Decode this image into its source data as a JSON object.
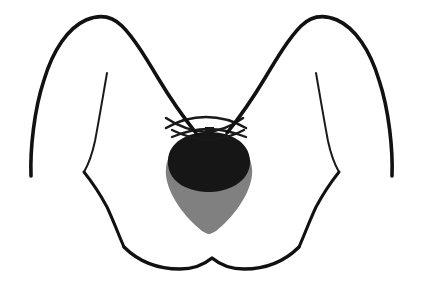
{
  "figure": {
    "caption": "",
    "background_color": "#ffffff",
    "width": 423,
    "height": 293
  },
  "palette": {
    "outline_black": "#111111",
    "mass_black": "#161616",
    "gland_gray": "#808080",
    "paper_white": "#ffffff"
  },
  "strokes": {
    "body_outline_width": 3.6,
    "inner_contour_width": 2.0,
    "clavicle_width": 2.6
  },
  "parts": [
    {
      "id": "left-shoulder-arm",
      "label": "Left shoulder and upper arm contour",
      "stroke_width": 3.6
    },
    {
      "id": "right-shoulder-arm",
      "label": "Right shoulder and upper arm contour",
      "stroke_width": 3.6
    },
    {
      "id": "left-axilla-fold",
      "label": "Left axillary fold line",
      "stroke_width": 2.0
    },
    {
      "id": "right-axilla-fold",
      "label": "Right axillary fold line",
      "stroke_width": 2.0
    },
    {
      "id": "left-pectoral-edge",
      "label": "Left pectoral border descending to costal margin",
      "stroke_width": 3.0
    },
    {
      "id": "right-pectoral-edge",
      "label": "Right pectoral border descending to costal margin",
      "stroke_width": 3.0
    },
    {
      "id": "costal-margin",
      "label": "Lower costal margin wavy contour",
      "stroke_width": 3.4
    },
    {
      "id": "left-clavicle-upper",
      "label": "Left clavicle upper arc",
      "stroke_width": 2.6
    },
    {
      "id": "right-clavicle-upper",
      "label": "Right clavicle upper arc",
      "stroke_width": 2.6
    },
    {
      "id": "left-clavicle-lower",
      "label": "Left clavicle lower arc",
      "stroke_width": 2.3
    },
    {
      "id": "right-clavicle-lower",
      "label": "Right clavicle lower arc",
      "stroke_width": 2.3
    },
    {
      "id": "thymus-gland-shape",
      "label": "Thymus gland shaded teardrop",
      "fill": "#808080"
    },
    {
      "id": "mediastinal-mass-shape",
      "label": "Dark superior mediastinal mass cap",
      "fill": "#161616"
    },
    {
      "id": "tracheal-nub",
      "label": "Small midline nub at superior border",
      "fill": "#161616"
    }
  ],
  "geometry": {
    "left_shoulder_arm_path": "M 31 176 C 30 150 34 110 44 80 C 53 50 68 28 86 20 C 100 14 112 16 122 26 C 134 38 146 58 158 78 C 170 98 184 118 196 133",
    "right_shoulder_arm_path": "M 392 176 C 393 150 389 110 379 80 C 370 50 355 28 337 20 C 323 14 311 16 301 26 C 289 38 277 58 265 78 C 253 98 239 118 227 133",
    "left_axilla_fold_path": "M 107 73 C 103 96 99 120 95 141 C 92 155 88 165 84 172",
    "right_axilla_fold_path": "M 316 73 C 320 96 324 120 328 141 C 331 155 335 165 339 172",
    "left_pectoral_edge_path": "M 84 172 C 92 182 100 194 107 207 C 114 222 119 236 124 247",
    "right_pectoral_edge_path": "M 339 172 C 331 182 323 194 316 207 C 309 222 304 236 299 247",
    "costal_margin_path": "M 124 247 C 138 261 158 269 180 269 C 196 269 206 263 212 258 C 218 263 228 269 244 269 C 266 269 285 261 299 247",
    "left_clavicle_upper_path": "M 166 118 C 178 126 192 131 206 132 C 220 131 232 126 243 118",
    "right_clavicle_upper_path": "M 166 128 C 178 121 192 117 206 117 C 220 117 234 121 246 128",
    "left_clavicle_lower_path": "M 172 130 C 184 136 196 139 208 140 C 221 139 233 136 244 130",
    "right_clavicle_lower_path": "M 172 137 C 184 132 196 129 208 129 C 221 129 233 132 246 137",
    "thymus_gland_path": "M 209 134 C 232 134 250 148 252 168 C 254 186 240 208 226 222 C 219 229 213 234 209 234 C 205 234 199 229 192 222 C 178 208 164 186 166 168 C 168 148 186 134 209 134 Z",
    "mediastinal_mass_path": "M 209 132 C 232 132 249 143 250 160 C 251 172 243 182 232 187 C 223 191 216 192 209 192 C 202 192 194 191 185 187 C 174 182 167 172 168 160 C 169 143 186 132 209 132 Z",
    "tracheal_nub_path": "M 205 127 L 214 127 L 214 134 L 205 134 Z"
  }
}
